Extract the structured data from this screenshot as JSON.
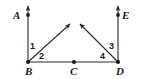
{
  "figure": {
    "type": "geometry-diagram",
    "stroke_color": "#2b2b2b",
    "background_color": "#ffffff",
    "point_marker_color": "#1a1a1a"
  },
  "points": {
    "A": {
      "label": "A",
      "x": 28,
      "y": 15
    },
    "B": {
      "label": "B",
      "x": 28,
      "y": 62
    },
    "C": {
      "label": "C",
      "x": 74,
      "y": 62
    },
    "D": {
      "label": "D",
      "x": 118,
      "y": 62
    },
    "E": {
      "label": "E",
      "x": 118,
      "y": 15
    }
  },
  "angles": {
    "one": {
      "label": "1",
      "vertex": "B"
    },
    "two": {
      "label": "2",
      "vertex": "B"
    },
    "three": {
      "label": "3",
      "vertex": "D"
    },
    "four": {
      "label": "4",
      "vertex": "D"
    }
  },
  "segments": {
    "ray_BA": {
      "from": "B",
      "to": "A",
      "arrow": true
    },
    "ray_DE": {
      "from": "D",
      "to": "E",
      "arrow": true
    },
    "ray_B_up_right": {
      "from": "B",
      "arrow": true
    },
    "ray_D_up_left": {
      "from": "D",
      "arrow": true
    },
    "segment_BD": {
      "from": "B",
      "to": "D",
      "arrow": false
    }
  }
}
